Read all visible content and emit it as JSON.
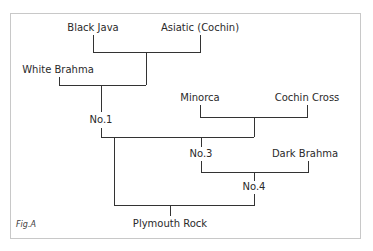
{
  "diagram": {
    "type": "pedigree-tree",
    "caption": "Fig.A",
    "line_color": "#333333",
    "border_color": "#c8c8c8",
    "nodes": [
      {
        "id": "black_java",
        "label": "Black Java"
      },
      {
        "id": "asiatic_cochin",
        "label": "Asiatic (Cochin)"
      },
      {
        "id": "white_brahma",
        "label": "White Brahma"
      },
      {
        "id": "no1",
        "label": "No.1"
      },
      {
        "id": "minorca",
        "label": "Minorca"
      },
      {
        "id": "cochin_cross",
        "label": "Cochin Cross"
      },
      {
        "id": "no3",
        "label": "No.3"
      },
      {
        "id": "dark_brahma",
        "label": "Dark Brahma"
      },
      {
        "id": "no4",
        "label": "No.4"
      },
      {
        "id": "plymouth_rock",
        "label": "Plymouth Rock"
      }
    ],
    "edges": [
      {
        "parents": [
          "Black Java",
          "Asiatic (Cochin)"
        ],
        "child": "No.1",
        "with": "White Brahma"
      },
      {
        "parents": [
          "Minorca",
          "Cochin Cross"
        ],
        "child": "No.3",
        "with": "No.1"
      },
      {
        "parents": [
          "No.3",
          "Dark Brahma"
        ],
        "child": "No.4"
      },
      {
        "parents": [
          "No.1",
          "No.4"
        ],
        "child": "Plymouth Rock"
      }
    ]
  }
}
